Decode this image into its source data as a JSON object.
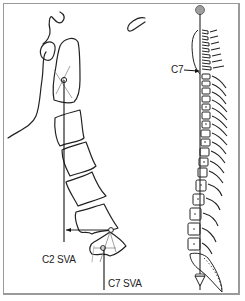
{
  "figure": {
    "left_panel": {
      "title": "Lateral cervical spine with sagittal vertical axes",
      "labels": {
        "c2_sva": "C2 SVA",
        "c7_sva": "C7 SVA"
      }
    },
    "right_panel": {
      "title": "Whole spine lateral view with plumb line",
      "labels": {
        "c7": "C7"
      }
    },
    "colors": {
      "line": "#222222",
      "frame": "#9a9a9a",
      "plumb_bob": "#9e9e9e"
    }
  }
}
